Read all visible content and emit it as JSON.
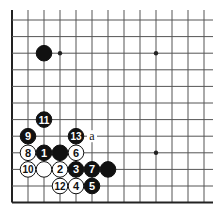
{
  "diagram": {
    "type": "go-board-fragment",
    "grid": {
      "x0": 12,
      "y0": 20,
      "spacing_x": 16,
      "spacing_y": 16.6,
      "cols": 13,
      "rows": 12,
      "left_edge": true,
      "bottom_edge": true,
      "line_color": "#555555",
      "edge_color": "#222222"
    },
    "star_points": [
      [
        3,
        2
      ],
      [
        9,
        2
      ],
      [
        9,
        8
      ]
    ],
    "stones": [
      {
        "col": 2,
        "row": 2,
        "color": "black",
        "label": ""
      },
      {
        "col": 2,
        "row": 6,
        "color": "black",
        "label": "11"
      },
      {
        "col": 1,
        "row": 7,
        "color": "black",
        "label": "9"
      },
      {
        "col": 4,
        "row": 7,
        "color": "black",
        "label": "13"
      },
      {
        "col": 1,
        "row": 8,
        "color": "white",
        "label": "8"
      },
      {
        "col": 2,
        "row": 8,
        "color": "black",
        "label": "1"
      },
      {
        "col": 3,
        "row": 8,
        "color": "black",
        "label": ""
      },
      {
        "col": 4,
        "row": 8,
        "color": "white",
        "label": "6"
      },
      {
        "col": 1,
        "row": 9,
        "color": "white",
        "label": "10"
      },
      {
        "col": 2,
        "row": 9,
        "color": "white",
        "label": ""
      },
      {
        "col": 3,
        "row": 9,
        "color": "white",
        "label": "2"
      },
      {
        "col": 4,
        "row": 9,
        "color": "black",
        "label": "3"
      },
      {
        "col": 5,
        "row": 9,
        "color": "black",
        "label": "7"
      },
      {
        "col": 6,
        "row": 9,
        "color": "black",
        "label": ""
      },
      {
        "col": 3,
        "row": 10,
        "color": "white",
        "label": "12"
      },
      {
        "col": 4,
        "row": 10,
        "color": "white",
        "label": "4"
      },
      {
        "col": 5,
        "row": 10,
        "color": "black",
        "label": "5"
      }
    ],
    "markers": [
      {
        "col": 5,
        "row": 7,
        "label": "a"
      }
    ]
  }
}
